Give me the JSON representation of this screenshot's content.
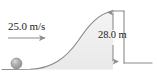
{
  "figure": {
    "type": "physics-diagram",
    "width": 157,
    "height": 80,
    "background_color": "#ffffff"
  },
  "labels": {
    "velocity": "25.0 m/s",
    "height": "28.0 m"
  },
  "colors": {
    "outline": "#8a8a8a",
    "hill_fill": "#f0f0f0",
    "ball_fill": "#9d9d9d",
    "ball_highlight": "#c9c9c9",
    "arrow": "#8d8d8d",
    "text": "#1c1c1c",
    "ground": "#8a8a8a"
  },
  "elements": {
    "ball": {
      "name": "ball",
      "cx": 16.5,
      "cy": 63.5,
      "r": 5.5
    },
    "velocity_arrow": {
      "name": "velocity-arrow",
      "x1": 8,
      "y1": 38,
      "x2": 48,
      "y2": 38,
      "direction": "right"
    },
    "height_arrow": {
      "name": "height-dimension-arrow",
      "x": 113,
      "y_top": 11,
      "y_bottom": 63,
      "direction": "both"
    },
    "hill": {
      "name": "hill-slope",
      "crest_x": 113,
      "crest_y": 11,
      "base_y": 69
    },
    "cliff_wall": {
      "name": "cliff-wall",
      "x": 124,
      "y_top": 11,
      "y_bottom": 63
    },
    "ground_right": {
      "name": "ground-line-right",
      "x1": 124,
      "y1": 63,
      "x2": 152,
      "y2": 63
    }
  }
}
